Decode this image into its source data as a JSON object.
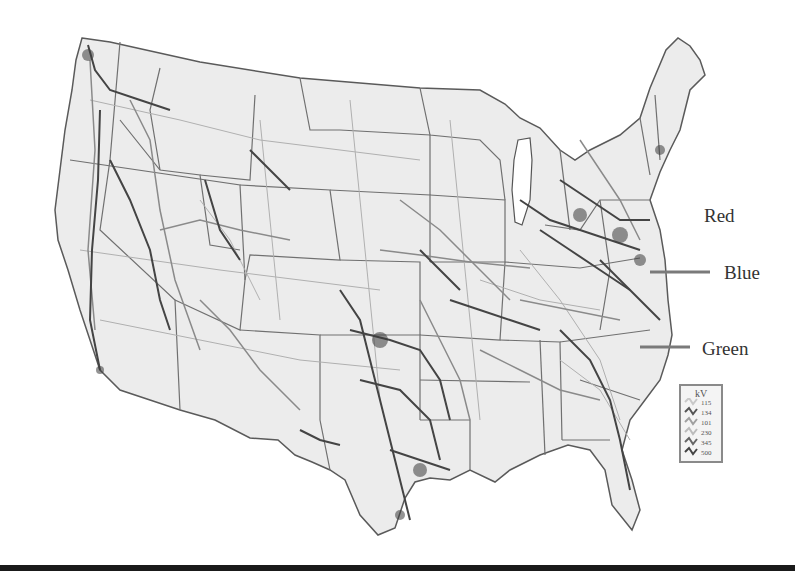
{
  "map": {
    "subject": "United States electric power transmission grid",
    "style": "grayscale",
    "colors": {
      "land": "#ececec",
      "state_borders": "#6e6e6e",
      "lines_low": "#b5b5b5",
      "lines_mid": "#8c8c8c",
      "lines_high": "#4a4a4a",
      "background": "#ffffff"
    }
  },
  "annotations": [
    {
      "label": "Red",
      "has_leader_line": false
    },
    {
      "label": "Blue",
      "has_leader_line": true
    },
    {
      "label": "Green",
      "has_leader_line": true
    }
  ],
  "legend": {
    "title": "kV",
    "entries": [
      "115",
      "134",
      "101",
      "230",
      "345",
      "500"
    ]
  }
}
